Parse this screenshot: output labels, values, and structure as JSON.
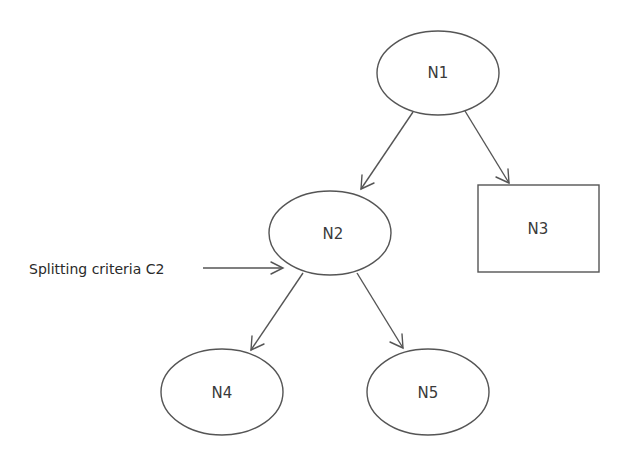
{
  "diagram": {
    "type": "decision-tree",
    "nodes": [
      {
        "id": "N1",
        "label": "N1",
        "shape": "ellipse"
      },
      {
        "id": "N2",
        "label": "N2",
        "shape": "ellipse"
      },
      {
        "id": "N3",
        "label": "N3",
        "shape": "rectangle"
      },
      {
        "id": "N4",
        "label": "N4",
        "shape": "ellipse"
      },
      {
        "id": "N5",
        "label": "N5",
        "shape": "ellipse"
      }
    ],
    "edges": [
      {
        "from": "N1",
        "to": "N2"
      },
      {
        "from": "N1",
        "to": "N3"
      },
      {
        "from": "N2",
        "to": "N4"
      },
      {
        "from": "N2",
        "to": "N5"
      }
    ],
    "annotation": {
      "label": "Splitting criteria C2",
      "points_to": "N2"
    },
    "colors": {
      "stroke": "#555555",
      "text": "#3a3a3a",
      "background": "#ffffff"
    }
  }
}
